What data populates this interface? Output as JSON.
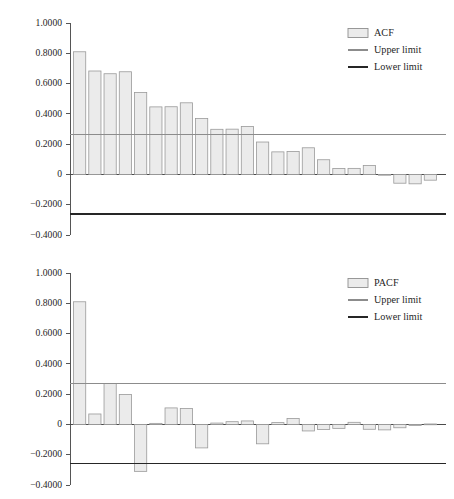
{
  "figure": {
    "background_color": "#ffffff",
    "bar_fill_color": "#ebebeb",
    "bar_border_color": "#9a9a9a",
    "upper_limit_color": "#8c8c8c",
    "lower_limit_color": "#262626",
    "axis_color": "#555555"
  },
  "chart_data": [
    {
      "type": "bar",
      "name": "acf-chart",
      "title": "",
      "xlabel": "",
      "ylabel": "",
      "ylim": [
        -0.4,
        1.0
      ],
      "yticks": [
        1.0,
        0.8,
        0.6,
        0.4,
        0.2,
        0.0,
        -0.2,
        -0.4
      ],
      "ytick_labels": [
        "1.0000",
        "0.8000",
        "0.6000",
        "0.4000",
        "0.2000",
        "0",
        "−0.2000",
        "−0.4000"
      ],
      "grid": false,
      "legend_position": "top-right",
      "legend": [
        {
          "label": "ACF",
          "marker": "filled-square"
        },
        {
          "label": "Upper limit",
          "marker": "thin-line"
        },
        {
          "label": "Lower limit",
          "marker": "thick-line"
        }
      ],
      "series": [
        {
          "name": "ACF",
          "categories": [
            1,
            2,
            3,
            4,
            5,
            6,
            7,
            8,
            9,
            10,
            11,
            12,
            13,
            14,
            15,
            16,
            17,
            18,
            19,
            20,
            21,
            22,
            23,
            24
          ],
          "values": [
            0.81,
            0.683,
            0.665,
            0.678,
            0.541,
            0.446,
            0.447,
            0.473,
            0.369,
            0.298,
            0.299,
            0.317,
            0.214,
            0.149,
            0.152,
            0.176,
            0.097,
            0.039,
            0.04,
            0.059,
            -0.005,
            -0.058,
            -0.062,
            -0.038
          ]
        }
      ],
      "reference_lines": [
        {
          "name": "Upper limit",
          "value": 0.263
        },
        {
          "name": "Lower limit",
          "value": -0.263
        }
      ]
    },
    {
      "type": "bar",
      "name": "pacf-chart",
      "title": "",
      "xlabel": "",
      "ylabel": "",
      "ylim": [
        -0.4,
        1.0
      ],
      "yticks": [
        1.0,
        0.8,
        0.6,
        0.4,
        0.2,
        0.0,
        -0.2,
        -0.4
      ],
      "ytick_labels": [
        "1.0000",
        "0.8000",
        "0.6000",
        "0.4000",
        "0.2000",
        "0",
        "−0.2000",
        "−0.4000"
      ],
      "grid": false,
      "legend_position": "top-right",
      "legend": [
        {
          "label": "PACF",
          "marker": "filled-square"
        },
        {
          "label": "Upper limit",
          "marker": "thin-line"
        },
        {
          "label": "Lower limit",
          "marker": "thick-line"
        }
      ],
      "series": [
        {
          "name": "PACF",
          "categories": [
            1,
            2,
            3,
            4,
            5,
            6,
            7,
            8,
            9,
            10,
            11,
            12,
            13,
            14,
            15,
            16,
            17,
            18,
            19,
            20,
            21,
            22,
            23,
            24
          ],
          "values": [
            0.81,
            0.069,
            0.27,
            0.198,
            -0.31,
            0.007,
            0.109,
            0.105,
            -0.155,
            0.009,
            0.018,
            0.023,
            -0.128,
            0.012,
            0.039,
            -0.043,
            -0.034,
            -0.026,
            0.014,
            -0.032,
            -0.036,
            -0.022,
            -0.007,
            0.003
          ]
        }
      ],
      "reference_lines": [
        {
          "name": "Upper limit",
          "value": 0.268
        },
        {
          "name": "Lower limit",
          "value": -0.258
        }
      ]
    }
  ]
}
